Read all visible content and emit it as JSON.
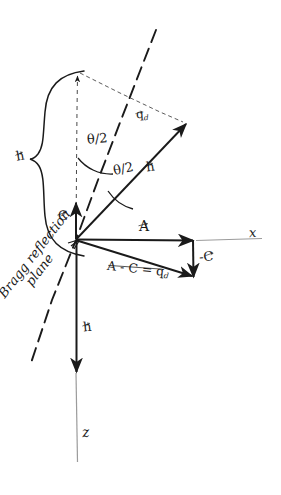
{
  "figure": {
    "kind": "hand-drawn vector diagram",
    "topic": "Bragg reflection geometry"
  },
  "axes": {
    "x_label": "x",
    "z_label": "z"
  },
  "angles": {
    "upper": "θ/2",
    "lower": "θ/2"
  },
  "vectors": {
    "a": "A",
    "c": "C",
    "minus_c": "-C",
    "h_diagonal": "h",
    "h_vertical": "h",
    "h_brace": "h",
    "q_top": "q",
    "q_top_sub": "d"
  },
  "equations": {
    "difference": "A - C = q",
    "difference_sub": "d"
  },
  "annotations": {
    "bragg_line1": "Bragg reflection",
    "bragg_line2": "plane"
  },
  "colors": {
    "ink": "#1a1a1a",
    "faint": "#8d8d8d",
    "paper": "#ffffff"
  }
}
